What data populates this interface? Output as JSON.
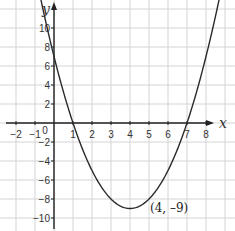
{
  "chart_data": {
    "type": "line",
    "title": "",
    "xlabel": "x",
    "ylabel": "y",
    "function": "y = x^2 - 8x + 7",
    "xlim": [
      -2.8,
      9.5
    ],
    "ylim": [
      -11.3,
      12.9
    ],
    "grid": true,
    "x_ticks": [
      -2,
      -1,
      0,
      1,
      2,
      3,
      4,
      5,
      6,
      7,
      8
    ],
    "x_tick_labels": [
      "-2",
      "-1",
      "0",
      "1",
      "2",
      "3",
      "4",
      "5",
      "6",
      "7",
      "8"
    ],
    "y_ticks": [
      -10,
      -8,
      -6,
      -4,
      -2,
      2,
      4,
      6,
      8,
      10
    ],
    "y_tick_labels": [
      "-10",
      "-8",
      "-6",
      "-4",
      "-2",
      "2",
      "4",
      "6",
      "8",
      "10"
    ],
    "series": [
      {
        "name": "parabola",
        "x": [
          -0.5,
          0,
          1,
          2,
          3,
          4,
          5,
          6,
          7,
          8,
          8.7
        ],
        "y": [
          11.25,
          7,
          0,
          -5,
          -8,
          -9,
          -8,
          -5,
          0,
          7,
          13.09
        ]
      }
    ],
    "annotations": [
      {
        "text": "(4, -9)",
        "x": 4,
        "y": -9
      }
    ],
    "roots": [
      1,
      7
    ],
    "y_intercept": 7,
    "vertex": [
      4,
      -9
    ]
  }
}
